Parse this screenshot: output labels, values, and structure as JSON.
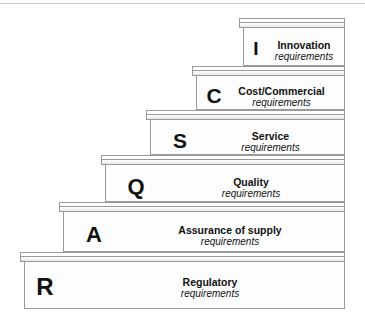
{
  "diagram": {
    "colors": {
      "background": "#ffffff",
      "step_fill": "#fdfdfd",
      "step_outline": "#9a9a9a",
      "text": "#111111",
      "top_rule": "#c8c8c8"
    },
    "steps": [
      {
        "letter": "I",
        "title": "Innovation",
        "subtitle": "requirements",
        "level": 6
      },
      {
        "letter": "C",
        "title": "Cost/Commercial",
        "subtitle": "requirements",
        "level": 5
      },
      {
        "letter": "S",
        "title": "Service",
        "subtitle": "requirements",
        "level": 4
      },
      {
        "letter": "Q",
        "title": "Quality",
        "subtitle": "requirements",
        "level": 3
      },
      {
        "letter": "A",
        "title": "Assurance of supply",
        "subtitle": "requirements",
        "level": 2
      },
      {
        "letter": "R",
        "title": "Regulatory",
        "subtitle": "requirements",
        "level": 1
      }
    ]
  }
}
